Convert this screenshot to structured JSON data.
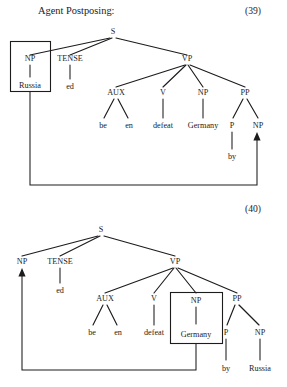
{
  "page": {
    "title": "Agent Postposing:",
    "width": 287,
    "height": 387,
    "ink_color": "#1c1c1c",
    "background_color": "#ffffff"
  },
  "examples": [
    {
      "number": "(39)",
      "description": "Deep structure tree with Russia as subject NP, boxed for movement into the empty NP of the by-phrase",
      "root": "S",
      "boxed_constituent": "NP",
      "boxed_word": "Russia",
      "empty_position": "NP under PP",
      "nodes": {
        "s": "S",
        "np_subject": "NP",
        "tense": "TENSE",
        "vp": "VP",
        "aux": "AUX",
        "v": "V",
        "np_object": "NP",
        "pp": "PP",
        "p": "P",
        "np_agent": "NP"
      },
      "leaves": {
        "subject_word": "Russia",
        "tense_word": "ed",
        "aux_word_1": "be",
        "aux_word_2": "en",
        "verb_word": "defeat",
        "object_word": "Germany",
        "preposition_word": "by"
      }
    },
    {
      "number": "(40)",
      "description": "Derived structure tree with Germany boxed in object position moving into the empty subject NP",
      "root": "S",
      "boxed_constituent": "NP",
      "boxed_word": "Germany",
      "empty_position": "NP under S",
      "nodes": {
        "s": "S",
        "np_subject": "NP",
        "tense": "TENSE",
        "vp": "VP",
        "aux": "AUX",
        "v": "V",
        "np_object": "NP",
        "pp": "PP",
        "p": "P",
        "np_agent": "NP"
      },
      "leaves": {
        "tense_word": "ed",
        "aux_word_1": "be",
        "aux_word_2": "en",
        "verb_word": "defeat",
        "object_word": "Germany",
        "preposition_word": "by",
        "agent_word": "Russia"
      }
    }
  ]
}
